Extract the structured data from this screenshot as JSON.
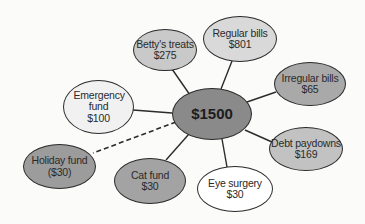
{
  "diagram": {
    "type": "budget-mind-map",
    "center": {
      "label": "$1500",
      "color": "#8a8a8a"
    },
    "nodes": [
      {
        "id": "bettys-treats",
        "name": "Betty's treats",
        "amount": "$275",
        "color": "#c9c9c9",
        "connector": "solid"
      },
      {
        "id": "regular-bills",
        "name": "Regular bills",
        "amount": "$801",
        "color": "#d9d9d9",
        "connector": "solid"
      },
      {
        "id": "irregular-bills",
        "name": "Irregular bills",
        "amount": "$65",
        "color": "#a9a9a9",
        "connector": "solid"
      },
      {
        "id": "debt-paydowns",
        "name": "Debt paydowns",
        "amount": "$169",
        "color": "#c2c2c2",
        "connector": "solid"
      },
      {
        "id": "eye-surgery",
        "name": "Eye surgery",
        "amount": "$30",
        "color": "#ffffff",
        "connector": "solid"
      },
      {
        "id": "cat-fund",
        "name": "Cat fund",
        "amount": "$30",
        "color": "#a3a3a3",
        "connector": "solid"
      },
      {
        "id": "holiday-fund",
        "name": "Holiday fund",
        "amount": "($30)",
        "color": "#9c9c9c",
        "connector": "dashed"
      },
      {
        "id": "emergency-fund",
        "name": "Emergency fund",
        "amount": "$100",
        "color": "#f1f1f1",
        "connector": "solid"
      }
    ]
  }
}
